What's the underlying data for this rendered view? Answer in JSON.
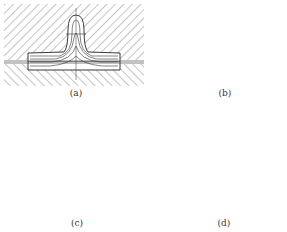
{
  "figure": {
    "panels": [
      {
        "id": "a",
        "caption": "(a)",
        "description": "Die cross-section with single central rib cavity, flow lines in workpiece"
      },
      {
        "id": "b",
        "caption": "(b)",
        "description": "Die cross-section with two rib cavities, flow lines along flange"
      },
      {
        "id": "c",
        "caption": "(c)",
        "description": "Closed die with deep U-shaped cavity, layered flow lines"
      },
      {
        "id": "d",
        "caption": "(d)",
        "description": "Upper and lower die with two deep ribs, cross-marked contour"
      }
    ]
  }
}
